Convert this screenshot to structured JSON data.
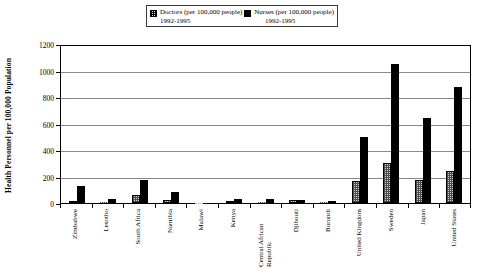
{
  "chart_data": {
    "type": "bar",
    "title": "",
    "subtitle": "",
    "xlabel": "",
    "ylabel": "Health Personnel per 100,000 Population",
    "ylim": [
      0,
      1200
    ],
    "ytick_step": 200,
    "yticks": [
      "1200",
      "1000",
      "800",
      "600",
      "400",
      "200",
      "0"
    ],
    "grid": true,
    "legend_position": "top-center",
    "categories": [
      "Zimbabwe",
      "Lesotho",
      "South Africa",
      "Namibia",
      "Malawi",
      "Kenya",
      "Central African Republic",
      "Djibouti",
      "Burundi",
      "United Kingdom",
      "Sweden",
      "Japan",
      "United States"
    ],
    "series": [
      {
        "name": "Doctors (per 100,000 people) 1992-1995",
        "legend_label": "Doctors (per 100,000 people)",
        "legend_years": "1992-1995",
        "color": "#cfcfcf",
        "pattern": "stipple",
        "values": [
          14,
          5,
          59,
          23,
          2,
          15,
          4,
          20,
          6,
          164,
          299,
          177,
          245
        ]
      },
      {
        "name": "Nurses (per 100,000 people) 1992-1995",
        "legend_label": "Nurses (per 100,000 people)",
        "legend_years": "1992-1995",
        "color": "#000000",
        "pattern": "solid",
        "values": [
          129,
          32,
          175,
          86,
          2,
          32,
          29,
          23,
          17,
          497,
          1047,
          645,
          878
        ]
      }
    ]
  },
  "legend": {
    "entries": [
      {
        "label": "Doctors (per 100,000 people)",
        "years": "1992-1995",
        "swatch": "doctors-swatch"
      },
      {
        "label": "Nurses (per 100,000 people)",
        "years": "1992-1995",
        "swatch": "nurses-swatch"
      }
    ]
  },
  "axis": {
    "y_title": "Health Personnel per 100,000 Population"
  }
}
